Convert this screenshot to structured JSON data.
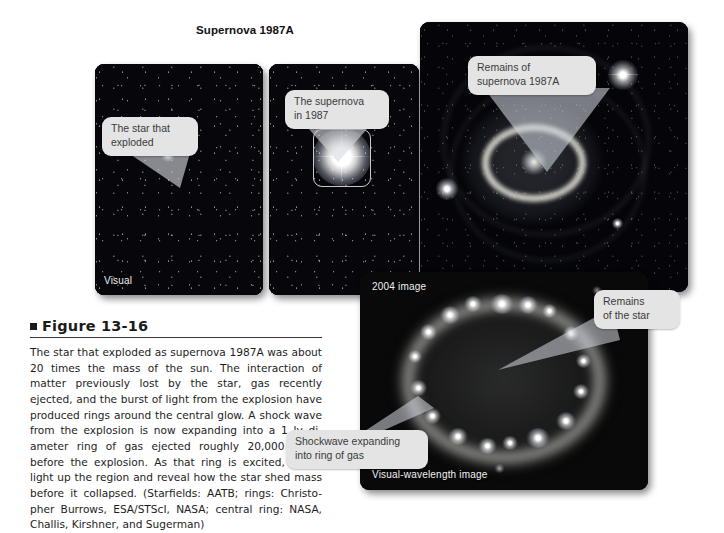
{
  "figure": {
    "marker": "■",
    "heading": "Figure 13-16",
    "caption": "The star that exploded as supernova 1987A was about 20 times the mass of the sun. The interaction of matter previously lost by the star, gas recently ejected, and the burst of light from the explosion have produced rings around the central glow. A shock wave from the explosion is now expanding into a 1 ly di-ameter ring of gas ejected roughly 20,000 years before the explosion. As that ring is excited, it will light up the region and reveal how the star shed mass before it collapsed. (Starfields: AATB; rings: Christo-pher Burrows, ESA/STScI, NASA; central ring: NASA, Challis, Kirshner, and Sugerman)"
  },
  "title": "Supernova 1987A",
  "panels": {
    "before": {
      "name": "before-explosion-panel",
      "corner_label": "Visual",
      "callout": "The star that\nexploded"
    },
    "after": {
      "name": "during-explosion-panel",
      "corner_label": "",
      "callout": "The supernova\nin 1987"
    },
    "rings": {
      "name": "three-ring-hubble-panel",
      "corner_label": "",
      "callout": "Remains of\nsupernova 1987A"
    },
    "ring2004": {
      "name": "ring-2004-panel",
      "corner_label_top": "2004 image",
      "corner_label_bottom": "Visual-wavelength image",
      "callout_star": "Remains\nof the star",
      "callout_shock": "Shockwave expanding\ninto ring of gas"
    }
  },
  "colors": {
    "page_background": "#ffffff",
    "panel_background": "#000000",
    "callout_fill": "#e4e4e4",
    "callout_text": "#3a3a3a",
    "caption_text": "#1d1d1d",
    "ring_glow": "#f3f1e8"
  }
}
